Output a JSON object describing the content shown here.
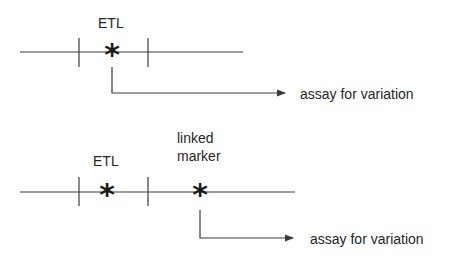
{
  "diagrams": [
    {
      "id": "top",
      "locus_label": "ETL",
      "marker_symbol": "*",
      "assay_label": "assay for variation",
      "assayed_site": "ETL"
    },
    {
      "id": "bottom",
      "locus_label": "ETL",
      "locus_symbol": "*",
      "linked_marker_label_line1": "linked",
      "linked_marker_label_line2": "marker",
      "linked_marker_symbol": "*",
      "assay_label": "assay for variation",
      "assayed_site": "linked marker"
    }
  ],
  "colors": {
    "line": "#3a3a3a",
    "text": "#262626",
    "symbol": "#1a1a1a"
  }
}
